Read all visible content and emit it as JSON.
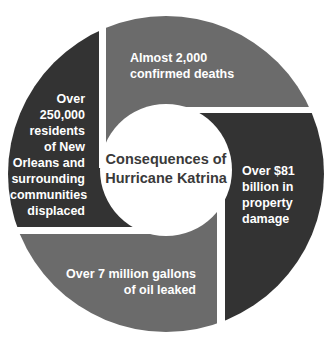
{
  "diagram": {
    "type": "segmented ring",
    "center": {
      "title_line1": "Consequences of",
      "title_line2": "Hurricane Katrina"
    },
    "segments": [
      {
        "position": "top",
        "color": "#6b6b6b",
        "lines": [
          "Almost 2,000",
          "confirmed deaths"
        ]
      },
      {
        "position": "right",
        "color": "#333333",
        "lines": [
          "Over $81",
          "billion in",
          "property",
          "damage"
        ]
      },
      {
        "position": "bottom",
        "color": "#6b6b6b",
        "lines": [
          "Over 7 million gallons",
          "of oil leaked"
        ]
      },
      {
        "position": "left",
        "color": "#333333",
        "lines": [
          "Over",
          "250,000",
          "residents",
          "of New",
          "Orleans and",
          "surrounding",
          "communities",
          "displaced"
        ]
      }
    ]
  }
}
